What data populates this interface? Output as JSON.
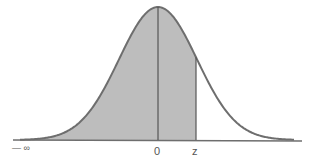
{
  "diagram": {
    "labels": {
      "neg_infinity": "— ∞",
      "zero": "0",
      "z": "z"
    },
    "colors": {
      "shade": "#bdbdbd",
      "curve": "#6e6e6e",
      "axis": "#6e6e6e",
      "background": "#ffffff"
    },
    "geometry": {
      "axis_y": 140,
      "axis_x_start": 13,
      "axis_x_end": 302,
      "mean_x": 158,
      "peak_y": 7,
      "sigma_px": 39,
      "z_x": 196
    }
  },
  "chart_data": {
    "type": "area",
    "title": "",
    "distribution": "standard normal",
    "shaded_region": {
      "from": "-infinity",
      "to": "z"
    },
    "x_tick_labels": [
      "— ∞",
      "0",
      "z"
    ],
    "z_value_approx": 1.0,
    "xlabel": "",
    "ylabel": ""
  }
}
